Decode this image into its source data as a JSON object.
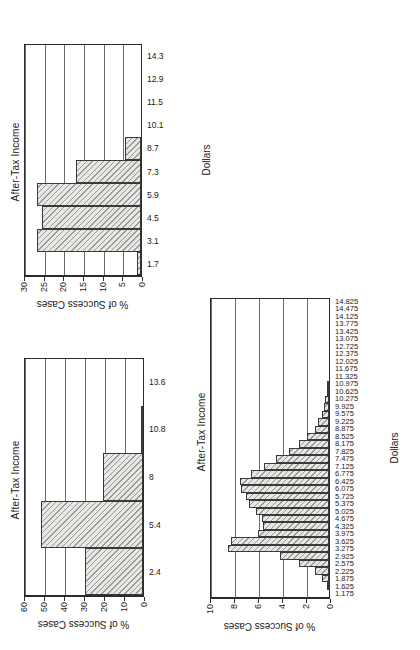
{
  "page": {
    "background": "#ffffff",
    "orientation": "rotated-90-ccw",
    "figure_count": 3
  },
  "shared": {
    "title": "After-Tax Income",
    "xlabel": "Dollars",
    "ylabel": "% of Success Cases",
    "bar_fill": "#e9e7e3",
    "bar_edge": "#3a3a3a",
    "axis_color": "#2b2b2b",
    "grid_color": "#6a6a6a"
  },
  "chart_data": [
    {
      "id": "chart-top-left",
      "type": "bar",
      "title": "After-Tax Income",
      "xlabel": "Dollars",
      "ylabel": "% of Success Cases",
      "categories": [
        "1.7",
        "3.1",
        "4.5",
        "5.9",
        "7.3",
        "8.7",
        "10.1",
        "11.5",
        "12.9",
        "14.3"
      ],
      "values": [
        1.0,
        26.5,
        25.3,
        26.5,
        16.5,
        4.0,
        0.0,
        0.0,
        0.0,
        0.0
      ],
      "ylim": [
        0,
        30
      ],
      "yticks": [
        0,
        5,
        10,
        15,
        20,
        25,
        30
      ],
      "grid": true,
      "legend": "none"
    },
    {
      "id": "chart-bottom-left",
      "type": "bar",
      "title": "After-Tax Income",
      "xlabel": "Dollars",
      "ylabel": "% of Success Cases",
      "categories": [
        "2.4",
        "5.4",
        "8",
        "10.8",
        "13.6"
      ],
      "values": [
        29.0,
        51.0,
        20.0,
        0.5,
        0.0
      ],
      "ylim": [
        0,
        60
      ],
      "yticks": [
        0,
        10,
        20,
        30,
        40,
        50,
        60
      ],
      "grid": true,
      "legend": "none"
    },
    {
      "id": "chart-hist",
      "type": "bar",
      "title": "After-Tax Income",
      "xlabel": "Dollars",
      "ylabel": "% of Success Cases",
      "categories": [
        "1.175",
        "1.625",
        "1.875",
        "2.225",
        "2.575",
        "2.925",
        "3.275",
        "3.625",
        "3.975",
        "4.325",
        "4.675",
        "5.025",
        "5.375",
        "5.725",
        "6.075",
        "6.425",
        "6.775",
        "7.125",
        "7.475",
        "7.825",
        "8.175",
        "8.525",
        "8.875",
        "9.225",
        "9.575",
        "9.925",
        "10.275",
        "10.625",
        "10.975",
        "11.325",
        "11.675",
        "12.025",
        "12.375",
        "12.725",
        "13.075",
        "13.425",
        "13.775",
        "14.125",
        "14.475",
        "14.825"
      ],
      "values": [
        0.0,
        0.15,
        0.6,
        1.2,
        2.5,
        4.1,
        8.4,
        8.2,
        5.9,
        5.5,
        5.6,
        6.1,
        6.7,
        6.9,
        7.3,
        7.4,
        6.5,
        5.4,
        4.4,
        3.3,
        2.5,
        1.8,
        1.2,
        0.9,
        0.6,
        0.45,
        0.3,
        0.2,
        0.15,
        0.0,
        0.0,
        0.0,
        0.0,
        0.0,
        0.0,
        0.0,
        0.0,
        0.0,
        0.0,
        0.0
      ],
      "ylim": [
        0,
        10
      ],
      "yticks": [
        0,
        2,
        4,
        6,
        8,
        10
      ],
      "grid": true,
      "legend": "none"
    }
  ]
}
